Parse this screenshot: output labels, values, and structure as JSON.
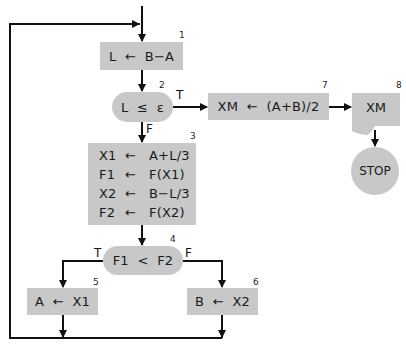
{
  "diagram": {
    "type": "flowchart",
    "title": "",
    "colors": {
      "fill": "#c8c8c8",
      "line": "#111111",
      "background": "#ffffff"
    },
    "nodes": [
      {
        "id": "1",
        "number": "1",
        "shape": "process",
        "text": "L  ←  B−A"
      },
      {
        "id": "2",
        "number": "2",
        "shape": "decision",
        "text": "L  ≤  ε"
      },
      {
        "id": "3",
        "number": "3",
        "shape": "process",
        "lines": [
          {
            "lhs": "X1",
            "arrow": "←",
            "rhs": "A+L/3"
          },
          {
            "lhs": "F1",
            "arrow": "←",
            "rhs": "F(X1)"
          },
          {
            "lhs": "X2",
            "arrow": "←",
            "rhs": "B−L/3"
          },
          {
            "lhs": "F2",
            "arrow": "←",
            "rhs": "F(X2)"
          }
        ]
      },
      {
        "id": "4",
        "number": "4",
        "shape": "decision",
        "text": "F1  <  F2"
      },
      {
        "id": "5",
        "number": "5",
        "shape": "process",
        "text": "A  ←  X1"
      },
      {
        "id": "6",
        "number": "6",
        "shape": "process",
        "text": "B  ←  X2"
      },
      {
        "id": "7",
        "number": "7",
        "shape": "process",
        "text": "XM  ←  (A+B)/2"
      },
      {
        "id": "8",
        "number": "8",
        "shape": "document",
        "text": "XM"
      },
      {
        "id": "stop",
        "shape": "terminal",
        "text": "STOP"
      }
    ],
    "edges": [
      {
        "from": "entry",
        "to": "1"
      },
      {
        "from": "1",
        "to": "2"
      },
      {
        "from": "2",
        "to": "7",
        "label": "T"
      },
      {
        "from": "2",
        "to": "3",
        "label": "F"
      },
      {
        "from": "3",
        "to": "4"
      },
      {
        "from": "4",
        "to": "5",
        "label": "T"
      },
      {
        "from": "4",
        "to": "6",
        "label": "F"
      },
      {
        "from": "5",
        "to": "1",
        "label": "loop"
      },
      {
        "from": "6",
        "to": "1",
        "label": "loop"
      },
      {
        "from": "7",
        "to": "8"
      },
      {
        "from": "8",
        "to": "stop"
      }
    ],
    "branch_labels": {
      "true": "T",
      "false": "F"
    }
  }
}
